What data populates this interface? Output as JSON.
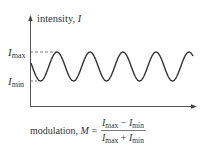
{
  "chart_data": {
    "type": "line",
    "title": "",
    "ylabel": "intensity, I",
    "xlabel": "",
    "y_ticks": [
      "I_max",
      "I_min"
    ],
    "series": [
      {
        "name": "intensity",
        "description": "sinusoidal oscillation between I_min and I_max",
        "cycles": 5
      }
    ],
    "annotations": [
      "dashed line from y-axis to first peak at I_max",
      "dashed tick at I_min"
    ]
  },
  "labels": {
    "y_axis": "intensity, ",
    "y_axis_var": "I",
    "imax_main": "I",
    "imax_sub": "max",
    "imin_main": "I",
    "imin_sub": "min"
  },
  "formula": {
    "prefix": "modulation, ",
    "var": "M",
    "equals": " =",
    "num_a": "I",
    "num_a_sub": "max",
    "num_op": " − ",
    "num_b": "I",
    "num_b_sub": "min",
    "den_a": "I",
    "den_a_sub": "max",
    "den_op": " + ",
    "den_b": "I",
    "den_b_sub": "min"
  }
}
